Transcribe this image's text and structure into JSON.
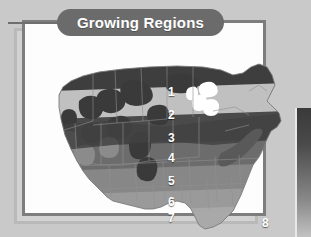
{
  "title": {
    "text": "Growing Regions",
    "banner_color": "#6b6b6b",
    "text_color": "#ffffff"
  },
  "map": {
    "name": "united-states-growing-regions-map",
    "description": "Grayscale map of the contiguous United States divided into eight horizontal growing-region bands",
    "background_color": "#ffffff",
    "state_border_color": "#8f8f8f",
    "zones": [
      {
        "number": "1",
        "label": "1",
        "shade": "#3f3f3f"
      },
      {
        "number": "2",
        "label": "2",
        "shade": "#c0c0c0"
      },
      {
        "number": "3",
        "label": "3",
        "shade": "#4a4a4a"
      },
      {
        "number": "4",
        "label": "4",
        "shade": "#6d6d6d"
      },
      {
        "number": "5",
        "label": "5",
        "shade": "#888888"
      },
      {
        "number": "6",
        "label": "6",
        "shade": "#9b9b9b"
      },
      {
        "number": "7",
        "label": "7",
        "shade": "#a9a9a9"
      },
      {
        "number": "8",
        "label": "8",
        "shade": "#7a7a7a"
      }
    ],
    "water_color": "#ffffff"
  },
  "frame": {
    "border_color": "#7d7d7d",
    "fill_color": "#ffffff",
    "shadow_color": "#b9b9b9"
  },
  "page": {
    "background_color": "#c9c9c9",
    "accent_bar_color": "#3a3a3a"
  }
}
